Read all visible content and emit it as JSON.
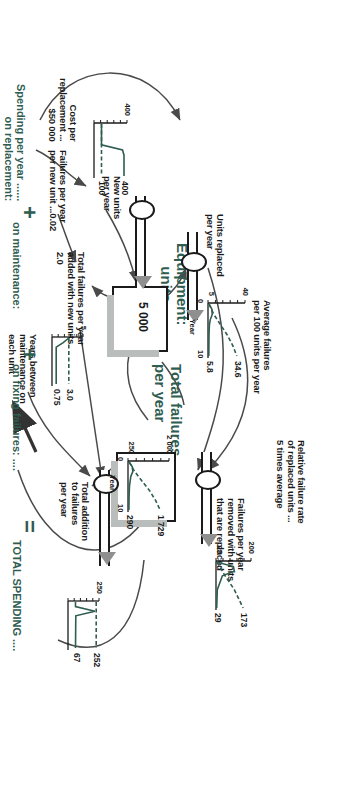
{
  "diagram": {
    "accent_color": "#2f5d52",
    "ink_color": "#1b1b1b"
  },
  "stocks": [
    {
      "name": "equipment-units",
      "label": "Equipment:\nunits",
      "value": "5 000"
    },
    {
      "name": "total-failures-per-year",
      "label": "Total failures\nper year",
      "value": ""
    }
  ],
  "flows": [
    {
      "name": "units-replaced-per-year",
      "label": "Units replaced\nper year"
    },
    {
      "name": "new-units-per-year",
      "label": "New units\nper year"
    },
    {
      "name": "failures-removed-with-units-replaced",
      "label": "Failures per year\nremoved with units\nthat are replaced"
    },
    {
      "name": "total-addition-to-failures-per-year",
      "label": "Total addition\nto failures\nper year"
    }
  ],
  "variables": [
    {
      "name": "average-failures-per-100-units",
      "label": "Average failures\nper 100 units per year"
    },
    {
      "name": "relative-failure-rate",
      "label": "Relative failure rate\nof replaced units ...\n5 times average"
    },
    {
      "name": "failures-per-new-unit",
      "label": "Failures per year\nper new unit ...0.02"
    },
    {
      "name": "total-failures-added-with-new-units",
      "label": "Total failures per year\nadded with new units\n2.0"
    },
    {
      "name": "years-between-maintenance",
      "label": "Years between\nmaintenance on\neach unit"
    },
    {
      "name": "cost-per-replacement",
      "label": "Cost per\nreplacement ...\n$50 000"
    }
  ],
  "bottom_rows": [
    {
      "name": "spending-on-replacement",
      "label": "Spending per year ......\non replacement:",
      "operator": ""
    },
    {
      "name": "spending-on-maintenance",
      "label": "on maintenance:",
      "operator": "+"
    },
    {
      "name": "spending-on-fixing-failures",
      "label": "on fixing failures: ....",
      "operator": "+"
    },
    {
      "name": "total-spending",
      "label": "TOTAL SPENDING ....",
      "operator": "="
    }
  ],
  "chart_data": [
    {
      "name": "new-units-per-year-chart",
      "type": "line",
      "title": "New units per year",
      "xlabel": "",
      "ylabel": "",
      "ylim": [
        0,
        400
      ],
      "ytick_labels": [
        "400"
      ],
      "series": [
        {
          "name": "scenario-a",
          "style": "solid",
          "end_label": "400",
          "x": [
            0,
            0.5,
            1,
            2,
            3,
            4,
            5,
            6,
            7,
            8,
            9,
            10
          ],
          "values": [
            100,
            100,
            100,
            100,
            100,
            100,
            380,
            400,
            400,
            400,
            400,
            400
          ]
        },
        {
          "name": "scenario-b",
          "style": "dashed",
          "end_label": "100",
          "x": [
            0,
            2,
            4,
            6,
            8,
            10
          ],
          "values": [
            100,
            100,
            100,
            100,
            100,
            100
          ]
        }
      ]
    },
    {
      "name": "years-between-maintenance-chart",
      "type": "line",
      "title": "Years between maintenance on each unit",
      "ylim": [
        0,
        5
      ],
      "ytick_labels": [
        "5"
      ],
      "series": [
        {
          "name": "scenario-a",
          "style": "dashed",
          "end_label": "3.0",
          "x": [
            0,
            10
          ],
          "values": [
            3.0,
            3.0
          ]
        },
        {
          "name": "scenario-b",
          "style": "solid",
          "end_label": "0.75",
          "x": [
            0,
            1,
            2,
            10
          ],
          "values": [
            3.0,
            2.0,
            0.75,
            0.75
          ]
        }
      ]
    },
    {
      "name": "average-failures-per-100-units-chart",
      "type": "line",
      "title": "Average failures per 100 units per year",
      "xlabel": "Year",
      "xlim": [
        0,
        10
      ],
      "xtick_labels": [
        "0",
        "10"
      ],
      "ylim": [
        5,
        40
      ],
      "ytick_labels": [
        "40",
        "5"
      ],
      "series": [
        {
          "name": "scenario-a",
          "style": "dashed",
          "end_label": "34.6",
          "x": [
            0,
            2,
            4,
            6,
            8,
            10
          ],
          "values": [
            6.0,
            11.0,
            18.0,
            25.0,
            30.5,
            34.6
          ]
        },
        {
          "name": "scenario-b",
          "style": "solid",
          "end_label": "5.8",
          "x": [
            0,
            1,
            2,
            3,
            4,
            6,
            8,
            10
          ],
          "values": [
            6.0,
            9.0,
            9.3,
            7.4,
            6.4,
            6.0,
            5.9,
            5.8
          ]
        }
      ]
    },
    {
      "name": "total-failures-per-year-chart",
      "type": "line",
      "title": "Total failures per year",
      "xlabel": "Year",
      "xlim": [
        0,
        10
      ],
      "xtick_labels": [
        "0",
        "10"
      ],
      "ylim": [
        250,
        2000
      ],
      "ytick_labels": [
        "2 000",
        "250"
      ],
      "series": [
        {
          "name": "scenario-a",
          "style": "dashed",
          "end_label": "1 729",
          "x": [
            0,
            2,
            4,
            6,
            8,
            10
          ],
          "values": [
            300,
            560,
            900,
            1250,
            1520,
            1729
          ]
        },
        {
          "name": "scenario-b",
          "style": "solid",
          "end_label": "290",
          "x": [
            0,
            1,
            2,
            3,
            5,
            7,
            10
          ],
          "values": [
            300,
            450,
            470,
            380,
            320,
            300,
            290
          ]
        }
      ]
    },
    {
      "name": "failures-removed-with-units-replaced-chart",
      "type": "line",
      "title": "Failures per year removed with units that are replaced",
      "ylim": [
        25,
        200
      ],
      "ytick_labels": [
        "200",
        "25"
      ],
      "series": [
        {
          "name": "scenario-a",
          "style": "dashed",
          "end_label": "173",
          "x": [
            0,
            3,
            6,
            10
          ],
          "values": [
            30,
            75,
            125,
            173
          ]
        },
        {
          "name": "scenario-b",
          "style": "solid",
          "end_label": "29",
          "x": [
            0,
            1,
            2,
            3,
            6,
            10
          ],
          "values": [
            30,
            120,
            125,
            60,
            32,
            29
          ]
        }
      ]
    },
    {
      "name": "total-addition-to-failures-per-year-chart",
      "type": "line",
      "title": "Total addition to failures per year",
      "ylim": [
        0,
        250
      ],
      "ytick_labels": [
        "250"
      ],
      "series": [
        {
          "name": "scenario-a",
          "style": "dashed",
          "end_label": "252",
          "x": [
            0,
            10
          ],
          "values": [
            252,
            252
          ]
        },
        {
          "name": "scenario-b",
          "style": "solid",
          "end_label": "67",
          "x": [
            0,
            1,
            2,
            3,
            10
          ],
          "values": [
            67,
            67,
            240,
            70,
            67
          ]
        }
      ]
    },
    {
      "name": "spending-on-replacement-chart",
      "type": "line",
      "title": "Spending per year on replacement",
      "ylim": [
        0,
        25
      ],
      "ytick_labels": [
        "25"
      ],
      "series": [
        {
          "name": "scenario-a",
          "style": "solid",
          "end_label": "20.0",
          "x": [
            0,
            1,
            2,
            3,
            4,
            5,
            10
          ],
          "values": [
            5.0,
            5.0,
            5.0,
            19.0,
            20.0,
            20.0,
            5.0
          ]
        },
        {
          "name": "scenario-b",
          "style": "dashed",
          "end_label": "5.0",
          "x": [
            0,
            10
          ],
          "values": [
            5.0,
            5.0
          ]
        }
      ]
    },
    {
      "name": "spending-on-maintenance-chart",
      "type": "line",
      "title": "Spending per year on maintenance",
      "ylim": [
        0,
        25
      ],
      "ytick_labels": [
        "25"
      ],
      "series": [
        {
          "name": "scenario-a",
          "style": "solid",
          "end_label": "20.0",
          "x": [
            0,
            1,
            2,
            10
          ],
          "values": [
            5.0,
            9.0,
            20.0,
            20.0
          ]
        },
        {
          "name": "scenario-b",
          "style": "dashed",
          "end_label": "5.0",
          "x": [
            0,
            10
          ],
          "values": [
            5.0,
            5.0
          ]
        }
      ]
    },
    {
      "name": "spending-on-fixing-failures-chart",
      "type": "line",
      "title": "Spending per year on fixing failures",
      "ylim": [
        5,
        40
      ],
      "ytick_labels": [
        "40",
        "5"
      ],
      "series": [
        {
          "name": "scenario-a",
          "style": "dashed",
          "end_label": "34.6",
          "x": [
            0,
            2,
            4,
            6,
            8,
            10
          ],
          "values": [
            6.0,
            11.0,
            18.0,
            25.0,
            30.5,
            34.6
          ]
        },
        {
          "name": "scenario-b",
          "style": "solid",
          "end_label": "5.8",
          "x": [
            0,
            1,
            2,
            3,
            4,
            6,
            8,
            10
          ],
          "values": [
            6.0,
            9.0,
            9.3,
            7.4,
            6.4,
            6.0,
            5.9,
            5.8
          ]
        }
      ]
    },
    {
      "name": "total-spending-chart",
      "type": "line",
      "title": "TOTAL SPENDING",
      "xlabel": "Year",
      "xlim": [
        0,
        10
      ],
      "xtick_labels": [
        "0",
        "10"
      ],
      "ylim": [
        15,
        50
      ],
      "ytick_labels": [
        "50",
        "15"
      ],
      "series": [
        {
          "name": "scenario-a",
          "style": "dashed",
          "end_label": "44.6",
          "x": [
            0,
            2,
            4,
            6,
            8,
            10
          ],
          "values": [
            16,
            21,
            28,
            35,
            40,
            44.6
          ]
        },
        {
          "name": "scenario-b",
          "style": "solid",
          "end_label": "30.8",
          "x": [
            0,
            1,
            2,
            3,
            4,
            5,
            6,
            8,
            10
          ],
          "values": [
            16,
            23,
            27,
            40,
            38,
            29,
            30,
            31,
            30.8
          ]
        }
      ]
    }
  ]
}
